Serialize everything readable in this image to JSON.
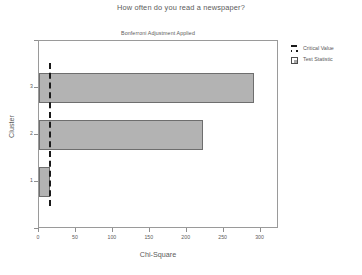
{
  "chart_data": {
    "type": "bar",
    "orientation": "horizontal",
    "title": "How often do you read a newspaper?",
    "subtitle": "Bonferroni Adjustment Applied",
    "xlabel": "Chi-Square",
    "ylabel": "Cluster",
    "categories": [
      "1",
      "2",
      "3"
    ],
    "series": [
      {
        "name": "Test Statistic",
        "values": [
          14.5,
          222,
          291
        ]
      }
    ],
    "reference_line": {
      "name": "Critical Value",
      "value": 14,
      "style": "dashed",
      "color": "#1a1a1a"
    },
    "xlim": [
      0,
      325
    ],
    "ylim": [
      0,
      4
    ],
    "xticks": [
      0,
      50,
      100,
      150,
      200,
      250,
      300
    ],
    "xtick_labels": [
      "0",
      "50",
      "100",
      "150",
      "200",
      "250",
      "300"
    ],
    "ytick_labels": [
      "1",
      "2",
      "3"
    ],
    "grid": false,
    "legend_position": "right",
    "bar_color": "#b3b3b3",
    "bar_edge_color": "#6e6e6e"
  },
  "titles": {
    "main": "How often do you read a newspaper?",
    "sub": "Bonferroni Adjustment Applied"
  },
  "axes": {
    "x_title": "Chi-Square",
    "y_title": "Cluster",
    "x_ticks": [
      {
        "label": "0",
        "value": 0
      },
      {
        "label": "50",
        "value": 50
      },
      {
        "label": "100",
        "value": 100
      },
      {
        "label": "150",
        "value": 150
      },
      {
        "label": "200",
        "value": 200
      },
      {
        "label": "250",
        "value": 250
      },
      {
        "label": "300",
        "value": 300
      }
    ],
    "y_ticks": [
      {
        "label": "",
        "value": 4
      },
      {
        "label": "3",
        "value": 3
      },
      {
        "label": "2",
        "value": 2
      },
      {
        "label": "1",
        "value": 1
      },
      {
        "label": "",
        "value": 0
      }
    ]
  },
  "legend": {
    "items": [
      {
        "label": "Critical Value",
        "key": "dashed-line-key"
      },
      {
        "label": "Test Statistic",
        "key": "square-swatch-key"
      }
    ]
  }
}
